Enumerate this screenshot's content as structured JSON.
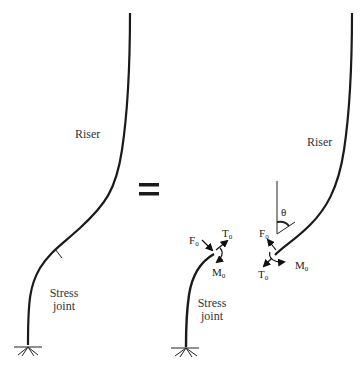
{
  "diagram": {
    "equals_sign": "=",
    "left_panel": {
      "riser_label": "Riser",
      "stress_joint_label_line1": "Stress",
      "stress_joint_label_line2": "joint"
    },
    "right_panel": {
      "riser_label": "Riser",
      "stress_joint_label_line1": "Stress",
      "stress_joint_label_line2": "joint",
      "angle_label": "θ",
      "lower_segment_forces": {
        "F": "F",
        "F_sub": "0",
        "T": "T",
        "T_sub": "0",
        "M": "M",
        "M_sub": "0"
      },
      "upper_segment_forces": {
        "F": "F",
        "F_sub": "0",
        "T": "T",
        "T_sub": "0",
        "M": "M",
        "M_sub": "0"
      }
    },
    "colors": {
      "line": "#1a1a1a",
      "text": "#333333"
    }
  }
}
